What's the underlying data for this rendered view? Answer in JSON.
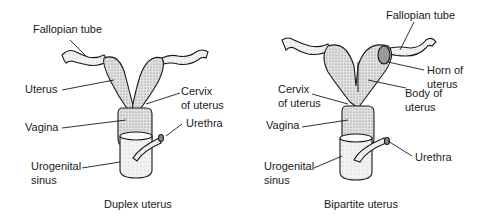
{
  "diagrams": [
    {
      "caption": "Duplex uterus",
      "labels": {
        "fallopian_tube": "Fallopian tube",
        "uterus": "Uterus",
        "cervix_1": "Cervix",
        "cervix_2": "of uterus",
        "vagina": "Vagina",
        "urethra": "Urethra",
        "urogenital_1": "Urogenital",
        "urogenital_2": "sinus"
      }
    },
    {
      "caption": "Bipartite uterus",
      "labels": {
        "fallopian_tube": "Fallopian tube",
        "horn_1": "Horn of",
        "horn_2": "uterus",
        "body_1": "Body of",
        "body_2": "uterus",
        "cervix_1": "Cervix",
        "cervix_2": "of uterus",
        "vagina": "Vagina",
        "urethra": "Urethra",
        "urogenital_1": "Urogenital",
        "urogenital_2": "sinus"
      }
    }
  ],
  "colors": {
    "ink": "#1a1a1a",
    "fill": "#cfcfcf",
    "background": "#ffffff"
  }
}
